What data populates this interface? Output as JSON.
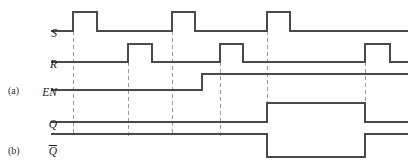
{
  "figure": {
    "type": "digital-timing-diagram",
    "width": 414,
    "height": 164,
    "background_color": "#ffffff",
    "trace_color": "#4a4a4a",
    "dashed_color": "#9a9a9a",
    "text_color": "#1d1d1d"
  },
  "part_labels": [
    {
      "id": "a",
      "text": "(a)",
      "x": 8,
      "y": 86
    },
    {
      "id": "b",
      "text": "(b)",
      "x": 8,
      "y": 146
    }
  ],
  "signals": [
    {
      "name": "S",
      "label": "S",
      "overbar": false,
      "baseline_y": 31,
      "high_y": 12,
      "label_x": 57,
      "label_y": 28,
      "segments": [
        {
          "from": 51,
          "to": 73,
          "level": "low"
        },
        {
          "from": 73,
          "to": 97,
          "level": "high"
        },
        {
          "from": 97,
          "to": 172,
          "level": "low"
        },
        {
          "from": 172,
          "to": 195,
          "level": "high"
        },
        {
          "from": 195,
          "to": 267,
          "level": "low"
        },
        {
          "from": 267,
          "to": 290,
          "level": "high"
        },
        {
          "from": 290,
          "to": 408,
          "level": "low"
        }
      ]
    },
    {
      "name": "R",
      "label": "R",
      "overbar": false,
      "baseline_y": 62,
      "high_y": 44,
      "label_x": 57,
      "label_y": 59,
      "segments": [
        {
          "from": 51,
          "to": 128,
          "level": "low"
        },
        {
          "from": 128,
          "to": 152,
          "level": "high"
        },
        {
          "from": 152,
          "to": 220,
          "level": "low"
        },
        {
          "from": 220,
          "to": 243,
          "level": "high"
        },
        {
          "from": 243,
          "to": 365,
          "level": "low"
        },
        {
          "from": 365,
          "to": 390,
          "level": "high"
        },
        {
          "from": 390,
          "to": 408,
          "level": "low"
        }
      ]
    },
    {
      "name": "EN",
      "label": "EN",
      "overbar": false,
      "baseline_y": 90,
      "high_y": 74,
      "label_x": 57,
      "label_y": 87,
      "segments": [
        {
          "from": 51,
          "to": 202,
          "level": "low"
        },
        {
          "from": 202,
          "to": 408,
          "level": "high"
        }
      ]
    },
    {
      "name": "Q",
      "label": "Q",
      "overbar": false,
      "baseline_y": 122,
      "high_y": 103,
      "label_x": 57,
      "label_y": 119,
      "segments": [
        {
          "from": 51,
          "to": 267,
          "level": "low"
        },
        {
          "from": 267,
          "to": 365,
          "level": "high"
        },
        {
          "from": 365,
          "to": 408,
          "level": "low"
        }
      ]
    },
    {
      "name": "Qbar",
      "label": "Q",
      "overbar": true,
      "baseline_y": 134,
      "high_y": 134,
      "low_y": 157,
      "label_x": 57,
      "label_y": 145,
      "segments": [
        {
          "from": 51,
          "to": 267,
          "level": "high"
        },
        {
          "from": 267,
          "to": 365,
          "level": "low"
        },
        {
          "from": 365,
          "to": 408,
          "level": "high"
        }
      ]
    }
  ],
  "dashed_lines": [
    {
      "id": "t1",
      "x": 73,
      "y_top": 31,
      "y_bottom": 136
    },
    {
      "id": "t2",
      "x": 128,
      "y_top": 62,
      "y_bottom": 136
    },
    {
      "id": "t3",
      "x": 172,
      "y_top": 31,
      "y_bottom": 136
    },
    {
      "id": "t4",
      "x": 220,
      "y_top": 62,
      "y_bottom": 136
    },
    {
      "id": "t5",
      "x": 267,
      "y_top": 31,
      "y_bottom": 122
    },
    {
      "id": "t6",
      "x": 365,
      "y_top": 62,
      "y_bottom": 122
    }
  ]
}
